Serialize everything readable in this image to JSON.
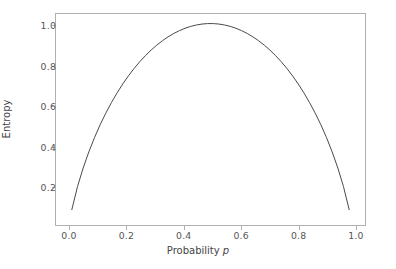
{
  "figure": {
    "background_color": "#ffffff",
    "axes_background_color": "#ffffff",
    "spine_color": "#b0b0b0",
    "tick_color": "#555555",
    "label_color": "#444444"
  },
  "chart_data": {
    "type": "line",
    "title": "",
    "xlabel_prefix": "Probability ",
    "xlabel_symbol": "p",
    "xlabel": "Probability p",
    "ylabel": "Entropy",
    "xlim": [
      -0.0495,
      1.0495
    ],
    "ylim": [
      0.0,
      1.052
    ],
    "grid": false,
    "legend": null,
    "line_color": "#4a4a4a",
    "line_width": 1.0,
    "xticks": [
      0.0,
      0.2,
      0.4,
      0.6,
      0.8,
      1.0
    ],
    "xtick_labels": [
      "0.0",
      "0.2",
      "0.4",
      "0.6",
      "0.8",
      "1.0"
    ],
    "yticks": [
      0.2,
      0.4,
      0.6,
      0.8,
      1.0
    ],
    "ytick_labels": [
      "0.2",
      "0.4",
      "0.6",
      "0.8",
      "1.0"
    ],
    "series": [
      {
        "name": "binary entropy",
        "formula": "H(p) = -p*log2(p) - (1-p)*log2(1-p)",
        "x": [
          0.01,
          0.03,
          0.05,
          0.07,
          0.09,
          0.11,
          0.13,
          0.15,
          0.17,
          0.19,
          0.21,
          0.23,
          0.25,
          0.27,
          0.29,
          0.31,
          0.33,
          0.35,
          0.37,
          0.39,
          0.41,
          0.43,
          0.45,
          0.47,
          0.49,
          0.51,
          0.53,
          0.55,
          0.57,
          0.59,
          0.61,
          0.63,
          0.65,
          0.67,
          0.69,
          0.71,
          0.73,
          0.75,
          0.77,
          0.79,
          0.81,
          0.83,
          0.85,
          0.87,
          0.89,
          0.91,
          0.93,
          0.95,
          0.97,
          0.99
        ],
        "y": [
          0.0808,
          0.1944,
          0.2864,
          0.3659,
          0.4365,
          0.4999,
          0.5574,
          0.6098,
          0.6577,
          0.7015,
          0.7415,
          0.778,
          0.8113,
          0.8415,
          0.8687,
          0.8932,
          0.9149,
          0.9341,
          0.9507,
          0.9648,
          0.9765,
          0.9858,
          0.9928,
          0.9974,
          0.9997,
          0.9997,
          0.9974,
          0.9928,
          0.9858,
          0.9765,
          0.9648,
          0.9507,
          0.9341,
          0.9149,
          0.8932,
          0.8687,
          0.8415,
          0.8113,
          0.778,
          0.7415,
          0.7015,
          0.6577,
          0.6098,
          0.5574,
          0.4999,
          0.4365,
          0.3659,
          0.2864,
          0.1944,
          0.0808
        ]
      }
    ]
  }
}
